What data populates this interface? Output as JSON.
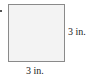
{
  "figure": {
    "shape": "square",
    "side_label": "3 in.",
    "bottom_label": "3 in.",
    "fill_color": "#f3f3f3",
    "stroke_color": "#8a8a8a"
  }
}
